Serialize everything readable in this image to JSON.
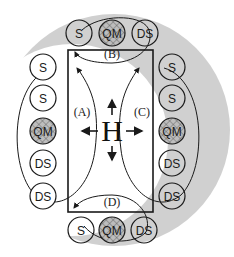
{
  "diagram": {
    "colors": {
      "background": "#ffffff",
      "shade": "#d0d0d0",
      "line": "#1a1a1a",
      "qm_fill": "#b8b8b8"
    },
    "center": {
      "label": "H"
    },
    "zones": [
      {
        "id": "A",
        "label": "(A)"
      },
      {
        "id": "B",
        "label": "(B)"
      },
      {
        "id": "C",
        "label": "(C)"
      },
      {
        "id": "D",
        "label": "(D)"
      }
    ],
    "groups": {
      "top": [
        "S",
        "QM",
        "DS"
      ],
      "bottom": [
        "S",
        "QM",
        "DS"
      ],
      "left": [
        "S",
        "S",
        "QM",
        "DS",
        "DS"
      ],
      "right": [
        "S",
        "S",
        "QM",
        "DS",
        "DS"
      ]
    }
  }
}
